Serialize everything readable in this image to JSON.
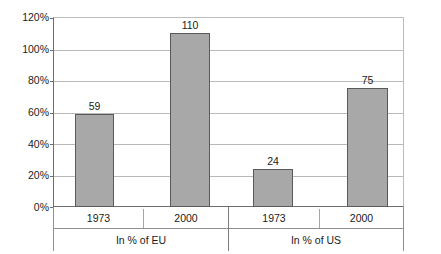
{
  "chart_data": {
    "type": "bar",
    "title": "",
    "xlabel": "",
    "ylabel": "",
    "ylim": [
      0,
      120
    ],
    "grid": true,
    "legend": "none",
    "y_ticks": [
      "0%",
      "20%",
      "40%",
      "60%",
      "80%",
      "100%",
      "120%"
    ],
    "y_tick_values": [
      0,
      20,
      40,
      60,
      80,
      100,
      120
    ],
    "group_labels": [
      "In % of EU",
      "In % of US"
    ],
    "categories": [
      "1973",
      "2000",
      "1973",
      "2000"
    ],
    "values": [
      59,
      110,
      24,
      75
    ],
    "value_labels": [
      "59",
      "110",
      "24",
      "75"
    ],
    "groups": [
      {
        "label": "In % of EU",
        "bars": [
          {
            "category": "1973",
            "value": 59,
            "label": "59"
          },
          {
            "category": "2000",
            "value": 110,
            "label": "110"
          }
        ]
      },
      {
        "label": "In % of US",
        "bars": [
          {
            "category": "1973",
            "value": 24,
            "label": "24"
          },
          {
            "category": "2000",
            "value": 75,
            "label": "75"
          }
        ]
      }
    ],
    "colors": {
      "bar_fill": "#a8a8a8",
      "bar_border": "#5a5a5a",
      "gridline": "#b9b9b9",
      "axis": "#6e6e6e",
      "text": "#1a1a1a",
      "background": "#ffffff"
    }
  }
}
